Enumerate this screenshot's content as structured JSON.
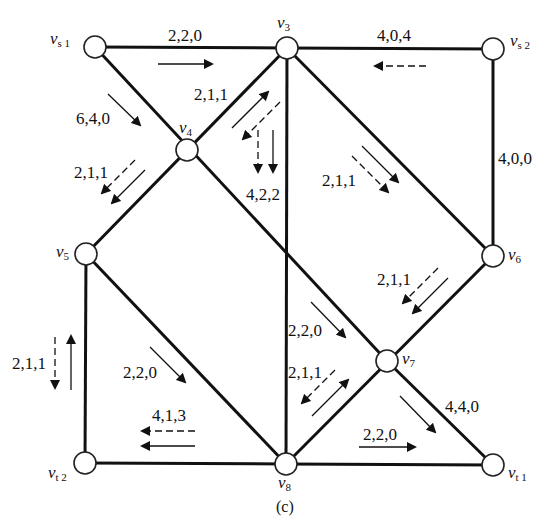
{
  "figure": {
    "caption": "(c)"
  },
  "nodes": [
    {
      "id": "vs1",
      "label": "v",
      "sub": "s 1",
      "x": 95,
      "y": 47
    },
    {
      "id": "v3",
      "label": "v",
      "sub": "3",
      "x": 287,
      "y": 48
    },
    {
      "id": "vs2",
      "label": "v",
      "sub": "s 2",
      "x": 493,
      "y": 49
    },
    {
      "id": "v4",
      "label": "v",
      "sub": "4",
      "x": 187,
      "y": 150
    },
    {
      "id": "v5",
      "label": "v",
      "sub": "5",
      "x": 86,
      "y": 254
    },
    {
      "id": "v6",
      "label": "v",
      "sub": "6",
      "x": 493,
      "y": 256
    },
    {
      "id": "v7",
      "label": "v",
      "sub": "7",
      "x": 387,
      "y": 361
    },
    {
      "id": "vt2",
      "label": "v",
      "sub": "t 2",
      "x": 85,
      "y": 463
    },
    {
      "id": "v8",
      "label": "v",
      "sub": "8",
      "x": 286,
      "y": 464
    },
    {
      "id": "vt1",
      "label": "v",
      "sub": "t 1",
      "x": 493,
      "y": 465
    }
  ],
  "edges": [
    {
      "from": "vs1",
      "to": "v3",
      "label": "2,2,0"
    },
    {
      "from": "vs2",
      "to": "v3",
      "label": "4,0,4"
    },
    {
      "from": "vs1",
      "to": "v4",
      "label": "6,4,0"
    },
    {
      "from": "v3",
      "to": "v4",
      "label": "2,1,1"
    },
    {
      "from": "v4",
      "to": "v5",
      "label": "2,1,1"
    },
    {
      "from": "v3",
      "to": "v8",
      "label": "4,2,2"
    },
    {
      "from": "v3",
      "to": "v6",
      "label": "2,1,1"
    },
    {
      "from": "vs2",
      "to": "v6",
      "label": "4,0,0"
    },
    {
      "from": "v6",
      "to": "v7",
      "label": "2,1,1"
    },
    {
      "from": "v4",
      "to": "v7",
      "label": "2,2,0"
    },
    {
      "from": "v7",
      "to": "v8",
      "label": "2,1,1"
    },
    {
      "from": "v7",
      "to": "vt1",
      "label": "4,4,0"
    },
    {
      "from": "v5",
      "to": "v8",
      "label": "2,2,0"
    },
    {
      "from": "v5",
      "to": "vt2",
      "label": "2,1,1"
    },
    {
      "from": "v8",
      "to": "vt2",
      "label": "4,1,3"
    },
    {
      "from": "v8",
      "to": "vt1",
      "label": "2,2,0"
    }
  ],
  "labels": {
    "e_vs1_v3": "2,2,0",
    "e_vs2_v3": "4,0,4",
    "e_vs1_v4": "6,4,0",
    "e_v3_v4": "2,1,1",
    "e_v4_v5": "2,1,1",
    "e_v3_v8": "4,2,2",
    "e_v3_v6": "2,1,1",
    "e_vs2_v6": "4,0,0",
    "e_v6_v7": "2,1,1",
    "e_v4_v7": "2,2,0",
    "e_v7_v8": "2,1,1",
    "e_v7_vt1": "4,4,0",
    "e_v5_v8": "2,2,0",
    "e_v5_vt2": "2,1,1",
    "e_v8_vt2": "4,1,3",
    "e_v8_vt1": "2,2,0"
  },
  "node_names": {
    "v": "v",
    "vs1_sub": "s 1",
    "v3_sub": "3",
    "vs2_sub": "s 2",
    "v4_sub": "4",
    "v5_sub": "5",
    "v6_sub": "6",
    "v7_sub": "7",
    "vt2_sub": "t 2",
    "v8_sub": "8",
    "vt1_sub": "t 1"
  },
  "legend": {
    "solid_arrow": "flow of commodity 1",
    "dashed_arrow": "flow of commodity 2"
  }
}
